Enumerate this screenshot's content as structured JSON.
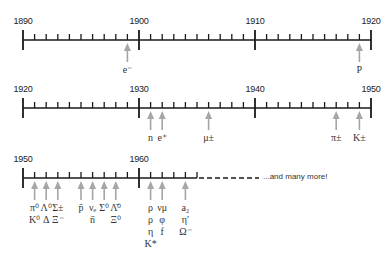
{
  "colors": {
    "axis": "#1a1a1a",
    "arrow": "#a6a6a6",
    "text": "#222222"
  },
  "rows": [
    {
      "years": [
        "1890",
        "1900",
        "1910",
        "1920"
      ],
      "start": 1890,
      "end": 1920,
      "discoveries": [
        {
          "year": 1899,
          "labels": [
            "e⁻"
          ]
        },
        {
          "year": 1919,
          "labels": [
            "P"
          ]
        }
      ]
    },
    {
      "years": [
        "1920",
        "1930",
        "1940",
        "1950"
      ],
      "start": 1920,
      "end": 1950,
      "discoveries": [
        {
          "year": 1931,
          "labels": [
            "n"
          ]
        },
        {
          "year": 1932,
          "labels": [
            "e⁺"
          ]
        },
        {
          "year": 1936,
          "labels": [
            "μ±"
          ]
        },
        {
          "year": 1947,
          "labels": [
            "π±"
          ]
        },
        {
          "year": 1949,
          "labels": [
            "K±"
          ]
        }
      ]
    },
    {
      "years": [
        "1950",
        "1960"
      ],
      "start": 1950,
      "end": 1960,
      "discoveries": [
        {
          "year": 1951,
          "labels": [
            "π⁰",
            "K⁰"
          ]
        },
        {
          "year": 1952,
          "labels": [
            "Λ⁰",
            "Δ"
          ]
        },
        {
          "year": 1953,
          "labels": [
            "Σ±",
            "Ξ⁻"
          ]
        },
        {
          "year": 1955,
          "labels": [
            "p̄"
          ]
        },
        {
          "year": 1956,
          "labels": [
            "νₑ",
            "n̄"
          ]
        },
        {
          "year": 1957,
          "labels": [
            "Σ⁰"
          ]
        },
        {
          "year": 1958,
          "labels": [
            "Λ̄⁰",
            "Ξ⁰"
          ]
        },
        {
          "year": 1961,
          "labels": [
            "ρ",
            "ρ",
            "η",
            "K*"
          ]
        },
        {
          "year": 1962,
          "labels": [
            "νμ",
            "φ",
            "f"
          ]
        },
        {
          "year": 1964,
          "labels": [
            "a₂",
            "η′",
            "Ω⁻"
          ]
        }
      ],
      "continuation_text": "...and many more!"
    }
  ]
}
